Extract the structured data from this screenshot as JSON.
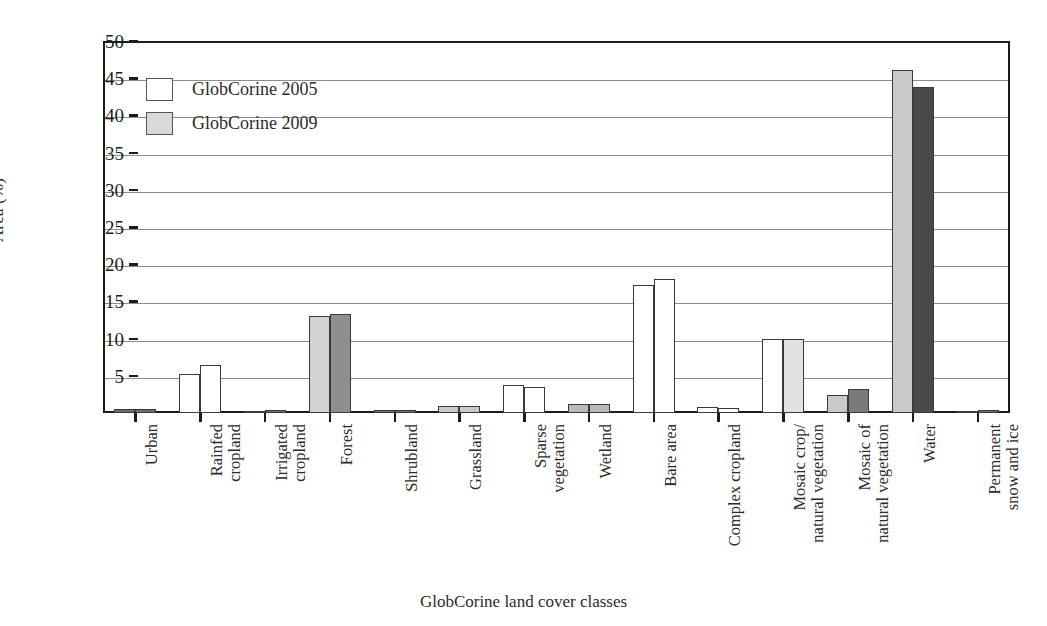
{
  "chart_data": {
    "type": "bar",
    "title": "",
    "xlabel": "GlobCorine land cover classes",
    "ylabel": "Area (%)",
    "ylim": [
      0,
      50
    ],
    "yticks": [
      0,
      5,
      10,
      15,
      20,
      25,
      30,
      35,
      40,
      45,
      50
    ],
    "ytick_labels": [
      "",
      "5",
      "10",
      "15",
      "20",
      "25",
      "30",
      "35",
      "40",
      "45",
      "50"
    ],
    "grid": true,
    "legend_position": "upper-left",
    "categories": [
      "Urban",
      "Rainfed\ncropland",
      "Irrigated\ncropland",
      "Forest",
      "Shrubland",
      "Grassland",
      "Sparse\nvegetation",
      "Wetland",
      "Bare area",
      "Complex cropland",
      "Mosaic crop/\nnatural vegetation",
      "Mosaic of\nnatural vegetation",
      "Water",
      "Permanent\nsnow and ice"
    ],
    "series": [
      {
        "name": "GlobCorine 2005",
        "color": "#ffffff",
        "values": [
          0.5,
          5.3,
          0.3,
          13.0,
          0.4,
          1.0,
          3.8,
          1.2,
          17.2,
          0.8,
          10.0,
          2.4,
          46.1,
          0.3
        ],
        "fills": [
          "#6e6e6e",
          "#ffffff",
          "#6e6e6e",
          "#d2d2d2",
          "#6e6e6e",
          "#c9c9c9",
          "#ffffff",
          "#b9b9b9",
          "#ffffff",
          "#ffffff",
          "#ffffff",
          "#c9c9c9",
          "#c9c9c9",
          "#6e6e6e"
        ]
      },
      {
        "name": "GlobCorine 2009",
        "color": "#d3d3d3",
        "values": [
          0.5,
          6.4,
          0.35,
          13.3,
          0.4,
          1.0,
          3.5,
          1.2,
          18.0,
          0.7,
          9.9,
          3.2,
          43.8,
          0.35
        ],
        "fills": [
          "#6e6e6e",
          "#ffffff",
          "#6e6e6e",
          "#8e8e8e",
          "#6e6e6e",
          "#c9c9c9",
          "#ffffff",
          "#b9b9b9",
          "#ffffff",
          "#ffffff",
          "#e2e2e2",
          "#7a7a7a",
          "#4a4a4a",
          "#6e6e6e"
        ]
      }
    ]
  },
  "legend": {
    "items": [
      {
        "label": "GlobCorine 2005",
        "swatch": "#ffffff"
      },
      {
        "label": "GlobCorine 2009",
        "swatch": "#d9d9d9"
      }
    ]
  },
  "axes": {
    "y_title": "Area (%)",
    "x_title": "GlobCorine land cover classes"
  }
}
